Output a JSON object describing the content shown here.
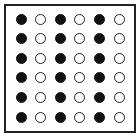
{
  "diagram": {
    "type": "dot-grid",
    "rows": 6,
    "columns": 6,
    "pattern": [
      [
        "filled",
        "hollow",
        "filled",
        "hollow",
        "filled",
        "hollow"
      ],
      [
        "filled",
        "hollow",
        "filled",
        "hollow",
        "filled",
        "hollow"
      ],
      [
        "filled",
        "hollow",
        "filled",
        "hollow",
        "filled",
        "hollow"
      ],
      [
        "filled",
        "hollow",
        "filled",
        "hollow",
        "filled",
        "hollow"
      ],
      [
        "filled",
        "hollow",
        "filled",
        "hollow",
        "filled",
        "hollow"
      ],
      [
        "filled",
        "hollow",
        "filled",
        "hollow",
        "filled",
        "hollow"
      ]
    ],
    "colors": {
      "filled": "#111111",
      "hollow_fill": "#ffffff",
      "outline": "#222222",
      "frame": "#222222"
    }
  }
}
